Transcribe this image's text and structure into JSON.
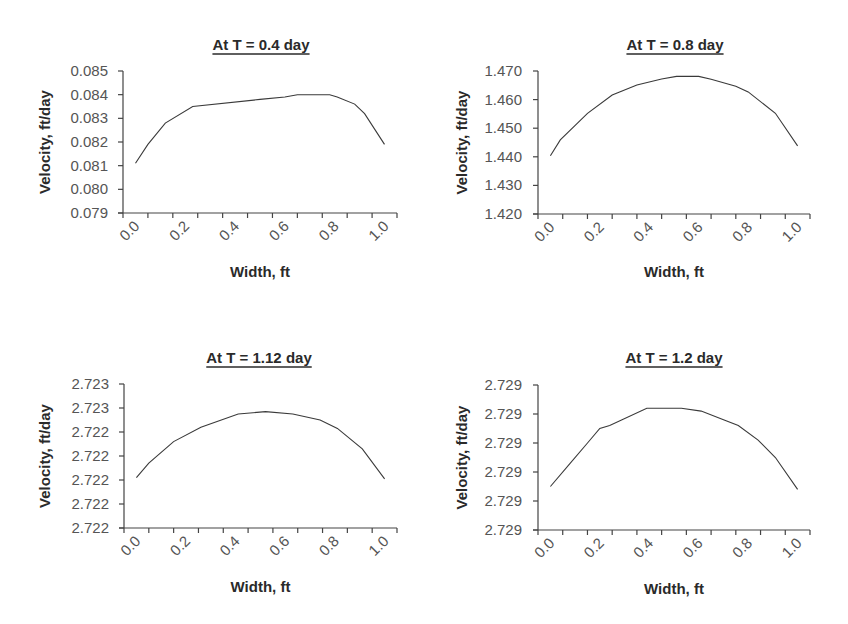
{
  "chart_data": [
    {
      "type": "line",
      "title": "At T = 0.4 day",
      "xlabel": "Width, ft",
      "ylabel": "Velocity, ft/day",
      "xlim": [
        0.0,
        1.0
      ],
      "x_tick_labels": [
        "0.0",
        "0.2",
        "0.4",
        "0.6",
        "0.8",
        "1.0"
      ],
      "ylim": [
        0.079,
        0.085
      ],
      "y_ticks": [
        0.079,
        0.08,
        0.081,
        0.082,
        0.083,
        0.084,
        0.085
      ],
      "y_tick_labels": [
        "0.079",
        "0.080",
        "0.081",
        "0.082",
        "0.083",
        "0.084",
        "0.085"
      ],
      "grid": false,
      "legend": "none",
      "series": [
        {
          "name": "Velocity",
          "x": [
            0.0,
            0.05,
            0.12,
            0.23,
            0.5,
            0.6,
            0.65,
            0.7,
            0.78,
            0.81,
            0.88,
            0.92,
            1.0
          ],
          "y": [
            0.0811,
            0.0819,
            0.0828,
            0.0835,
            0.0838,
            0.0839,
            0.084,
            0.084,
            0.084,
            0.0839,
            0.0836,
            0.0832,
            0.0819
          ]
        }
      ]
    },
    {
      "type": "line",
      "title": "At T = 0.8 day",
      "xlabel": "Width, ft",
      "ylabel": "Velocity, ft/day",
      "xlim": [
        0.0,
        1.0
      ],
      "x_tick_labels": [
        "0.0",
        "0.2",
        "0.4",
        "0.6",
        "0.8",
        "1.0"
      ],
      "ylim": [
        1.42,
        1.47
      ],
      "y_ticks": [
        1.42,
        1.43,
        1.44,
        1.45,
        1.46,
        1.47
      ],
      "y_tick_labels": [
        "1.420",
        "1.430",
        "1.440",
        "1.450",
        "1.460",
        "1.470"
      ],
      "grid": false,
      "legend": "none",
      "series": [
        {
          "name": "Velocity",
          "x": [
            0.0,
            0.04,
            0.15,
            0.25,
            0.35,
            0.45,
            0.51,
            0.6,
            0.65,
            0.75,
            0.8,
            0.91,
            1.0
          ],
          "y": [
            1.4404,
            1.4459,
            1.4552,
            1.4616,
            1.4651,
            1.4672,
            1.4681,
            1.4681,
            1.4671,
            1.4647,
            1.4627,
            1.4552,
            1.4438
          ]
        }
      ]
    },
    {
      "type": "line",
      "title": "At T = 1.12 day",
      "xlabel": "Width, ft",
      "ylabel": "Velocity, ft/day",
      "xlim": [
        0.0,
        1.0
      ],
      "x_tick_labels": [
        "0.0",
        "0.2",
        "0.4",
        "0.6",
        "0.8",
        "1.0"
      ],
      "ylim": [
        2.7216,
        2.7228
      ],
      "y_ticks": [
        2.7216,
        2.7218,
        2.722,
        2.7222,
        2.7224,
        2.7226,
        2.7228
      ],
      "y_tick_labels": [
        "2.722",
        "2.722",
        "2.722",
        "2.722",
        "2.722",
        "2.723",
        "2.723"
      ],
      "grid": false,
      "legend": "none",
      "series": [
        {
          "name": "Velocity",
          "x": [
            0.0,
            0.05,
            0.15,
            0.26,
            0.41,
            0.52,
            0.63,
            0.74,
            0.81,
            0.91,
            1.0
          ],
          "y": [
            2.72202,
            2.72214,
            2.72232,
            2.72244,
            2.72255,
            2.72257,
            2.72255,
            2.7225,
            2.72243,
            2.72226,
            2.72201
          ]
        }
      ]
    },
    {
      "type": "line",
      "title": "At T = 1.2 day",
      "xlabel": "Width, ft",
      "ylabel": "Velocity, ft/day",
      "xlim": [
        0.0,
        1.0
      ],
      "x_tick_labels": [
        "0.0",
        "0.2",
        "0.4",
        "0.6",
        "0.8",
        "1.0"
      ],
      "ylim": [
        2.7286,
        2.7291
      ],
      "y_ticks": [
        2.7286,
        2.7287,
        2.7288,
        2.7289,
        2.729,
        2.7291
      ],
      "y_tick_labels": [
        "2.729",
        "2.729",
        "2.729",
        "2.729",
        "2.729",
        "2.729"
      ],
      "grid": false,
      "legend": "none",
      "series": [
        {
          "name": "Velocity",
          "x": [
            0.0,
            0.08,
            0.15,
            0.2,
            0.24,
            0.39,
            0.53,
            0.61,
            0.7,
            0.76,
            0.84,
            0.91,
            1.0
          ],
          "y": [
            2.72875,
            2.72883,
            2.7289,
            2.72895,
            2.72896,
            2.72902,
            2.72902,
            2.72901,
            2.72898,
            2.72896,
            2.72891,
            2.72885,
            2.72874
          ]
        }
      ]
    }
  ]
}
